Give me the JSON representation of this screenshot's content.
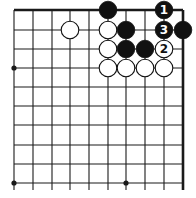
{
  "diagram": {
    "type": "go-board-corner",
    "grid": {
      "columns_x": [
        14,
        33,
        52,
        70,
        89,
        108,
        126,
        145,
        164,
        183
      ],
      "rows_y": [
        10,
        30,
        49,
        68,
        87,
        106,
        125,
        145,
        164,
        183
      ],
      "top_edge": true,
      "right_edge": true,
      "line_color": "#1a1a1a"
    },
    "star_points": [
      {
        "col": 0,
        "row": 3
      },
      {
        "col": 0,
        "row": 9
      },
      {
        "col": 6,
        "row": 9
      }
    ],
    "stones": [
      {
        "color": "black",
        "col": 5,
        "row": 0,
        "label": ""
      },
      {
        "color": "black",
        "col": 8,
        "row": 0,
        "label": "1"
      },
      {
        "color": "white",
        "col": 3,
        "row": 1,
        "label": ""
      },
      {
        "color": "white",
        "col": 5,
        "row": 1,
        "label": ""
      },
      {
        "color": "black",
        "col": 6,
        "row": 1,
        "label": ""
      },
      {
        "color": "black",
        "col": 8,
        "row": 1,
        "label": "3"
      },
      {
        "color": "black",
        "col": 9,
        "row": 1,
        "label": ""
      },
      {
        "color": "white",
        "col": 5,
        "row": 2,
        "label": ""
      },
      {
        "color": "black",
        "col": 6,
        "row": 2,
        "label": ""
      },
      {
        "color": "black",
        "col": 7,
        "row": 2,
        "label": ""
      },
      {
        "color": "white",
        "col": 8,
        "row": 2,
        "label": "2"
      },
      {
        "color": "white",
        "col": 5,
        "row": 3,
        "label": ""
      },
      {
        "color": "white",
        "col": 6,
        "row": 3,
        "label": ""
      },
      {
        "color": "white",
        "col": 7,
        "row": 3,
        "label": ""
      },
      {
        "color": "white",
        "col": 8,
        "row": 3,
        "label": ""
      }
    ],
    "colors": {
      "black_stone": "#111111",
      "white_stone": "#ffffff",
      "stone_outline": "#111111"
    }
  }
}
